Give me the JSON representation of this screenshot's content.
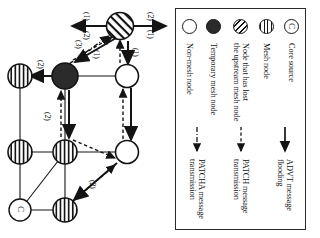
{
  "figure": {
    "rotation_degrees": 90,
    "caption": ""
  },
  "legend": {
    "title": "",
    "node_entries": [
      {
        "symbol": "core-source-node",
        "label": "Core source"
      },
      {
        "symbol": "mesh-node",
        "label": "Mesh node"
      },
      {
        "symbol": "node-lost-upstream",
        "label": "Node that has lost\nthe upstream mesh node"
      },
      {
        "symbol": "temporary-mesh-node",
        "label": "Temporary mesh node"
      },
      {
        "symbol": "non-mesh-node",
        "label": "Non-mesh node"
      }
    ],
    "line_entries": [
      {
        "symbol": "solid-arrow",
        "label": "ADVT message\nflooding"
      },
      {
        "symbol": "dashed-arrow",
        "label": "PATCH message\ntransmission"
      },
      {
        "symbol": "dash-dot-arrow",
        "label": "PATCHA message\ntransmission"
      }
    ]
  },
  "network": {
    "nodes": [
      {
        "id": "n-diag",
        "type": "node-lost-upstream",
        "letter": ""
      },
      {
        "id": "n-top-a",
        "type": "non-mesh-node",
        "letter": ""
      },
      {
        "id": "n-top-b",
        "type": "non-mesh-node",
        "letter": ""
      },
      {
        "id": "n-temp",
        "type": "temporary-mesh-node",
        "letter": ""
      },
      {
        "id": "n-mid-a",
        "type": "mesh-node",
        "letter": ""
      },
      {
        "id": "n-mid-b",
        "type": "mesh-node",
        "letter": ""
      },
      {
        "id": "n-bot-a",
        "type": "mesh-node",
        "letter": ""
      },
      {
        "id": "n-bot-b",
        "type": "mesh-node",
        "letter": ""
      },
      {
        "id": "n-core",
        "type": "core-source-node",
        "letter": "C"
      }
    ],
    "edge_labels": [
      {
        "id": "lbl-up-1",
        "text": "(1)"
      },
      {
        "id": "lbl-up-2",
        "text": "(2)"
      },
      {
        "id": "lbl-left-1",
        "text": "(1)"
      },
      {
        "id": "lbl-left-2",
        "text": "(2)"
      },
      {
        "id": "lbl-diag-top",
        "text": "(1)"
      },
      {
        "id": "lbl-diag-mid",
        "text": "(1)"
      },
      {
        "id": "lbl-diag-low",
        "text": "(3)"
      },
      {
        "id": "lbl-right-2",
        "text": "(2)"
      },
      {
        "id": "lbl-mid-2",
        "text": "(2)"
      },
      {
        "id": "lbl-down-2",
        "text": "(2)"
      }
    ]
  },
  "colors": {
    "ink": "#141414",
    "paper": "#ffffff",
    "solid_node": "#2b2b2b",
    "border": "#2a2a2a"
  }
}
